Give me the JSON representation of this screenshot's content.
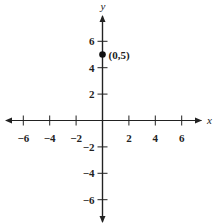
{
  "chart_data": {
    "type": "scatter",
    "title": "",
    "xlabel": "x",
    "ylabel": "y",
    "xlim": [
      -7.5,
      7.5
    ],
    "ylim": [
      -7.5,
      7.5
    ],
    "grid": false,
    "x_ticks": [
      -6,
      -4,
      -2,
      2,
      4,
      6
    ],
    "y_ticks": [
      -6,
      -4,
      -2,
      2,
      4,
      6
    ],
    "x_tick_labels": [
      "−6",
      "−4",
      "−2",
      "2",
      "4",
      "6"
    ],
    "y_tick_labels": [
      "−6",
      "−4",
      "−2",
      "2",
      "4",
      "6"
    ],
    "points": [
      {
        "x": 0,
        "y": 5,
        "label": "(0,5)"
      }
    ]
  }
}
